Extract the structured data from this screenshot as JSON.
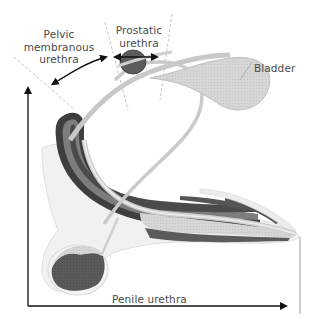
{
  "diagram": {
    "labels": {
      "pelvic": "Pelvic membranous urethra",
      "pelvic_line1": "Pelvic",
      "pelvic_line2": "membranous",
      "pelvic_line3": "urethra",
      "prostatic_line1": "Prostatic",
      "prostatic_line2": "urethra",
      "bladder": "Bladder",
      "penile": "Penile urethra"
    },
    "structures": [
      {
        "name": "bladder",
        "shape": "teardrop"
      },
      {
        "name": "prostate",
        "shape": "ellipse"
      },
      {
        "name": "urethra",
        "shape": "curved-tube"
      },
      {
        "name": "ductus-deferens",
        "shape": "curved-tube"
      },
      {
        "name": "bulb-of-penis",
        "shape": "curved-bands"
      },
      {
        "name": "testis",
        "shape": "oval"
      }
    ],
    "arrows": [
      {
        "name": "pelvic-membranous-arrow",
        "type": "double-headed-curved"
      },
      {
        "name": "prostatic-arrow",
        "type": "double-headed"
      },
      {
        "name": "vertical-axis-arrow",
        "type": "single-up"
      },
      {
        "name": "penile-axis-arrow",
        "type": "single-right"
      }
    ],
    "colors": {
      "dark": "#555555",
      "mid": "#8a8a8a",
      "light": "#c8c8c8",
      "pale": "#e4e4e4",
      "line": "#222222",
      "dashed": "#b0b0b0",
      "text": "#4a4a4a"
    }
  }
}
